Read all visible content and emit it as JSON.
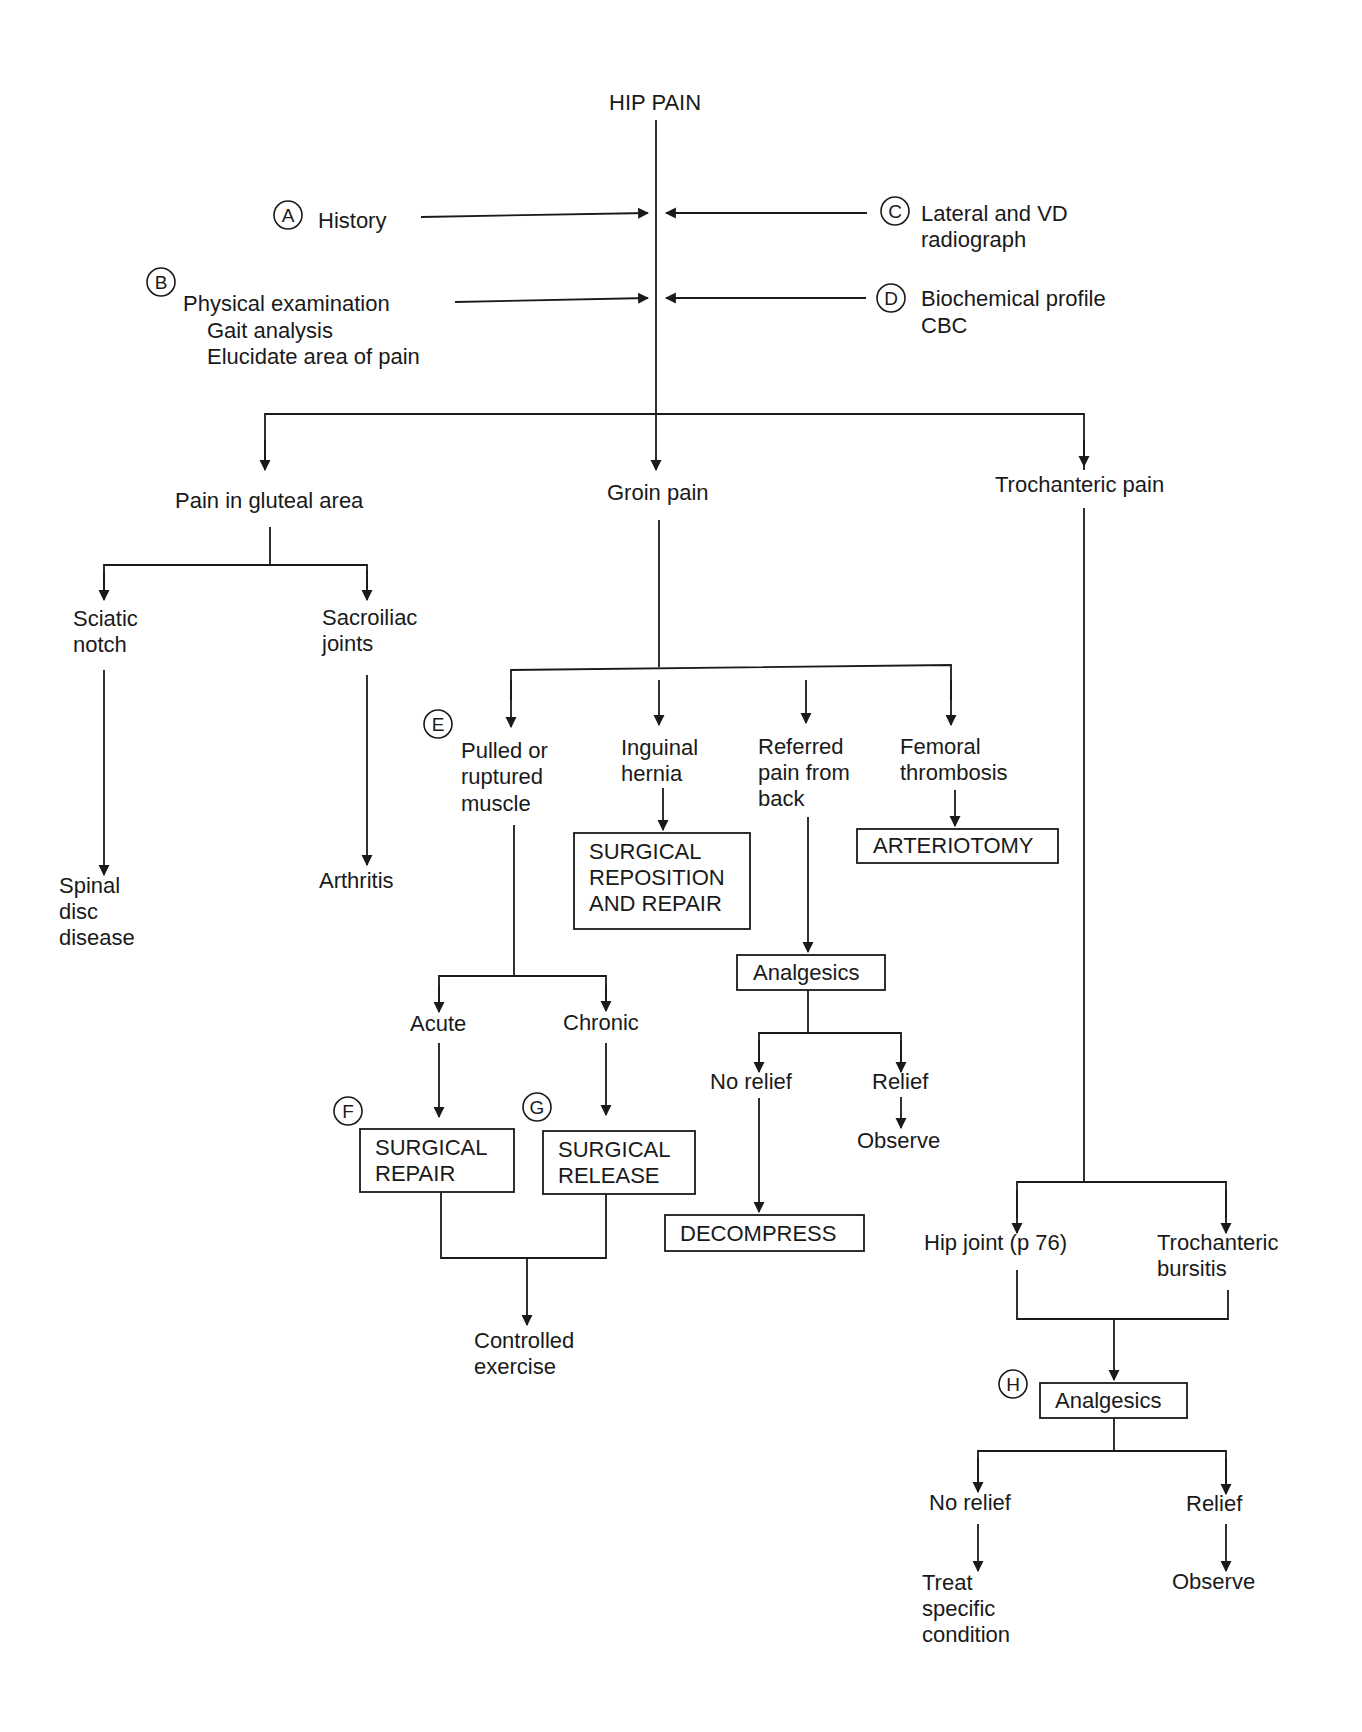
{
  "title": "HIP PAIN",
  "inputs": {
    "A": {
      "marker": "A",
      "lines": [
        "History"
      ]
    },
    "B": {
      "marker": "B",
      "lines": [
        "Physical examination",
        "Gait analysis",
        "Elucidate area of pain"
      ]
    },
    "C": {
      "marker": "C",
      "lines": [
        "Lateral and VD",
        "radiograph"
      ]
    },
    "D": {
      "marker": "D",
      "lines": [
        "Biochemical profile",
        "CBC"
      ]
    }
  },
  "branches": {
    "gluteal": {
      "label": "Pain in gluteal area",
      "sciatic": {
        "lines": [
          "Sciatic",
          "notch"
        ],
        "result": [
          "Spinal",
          "disc",
          "disease"
        ]
      },
      "sacroiliac": {
        "lines": [
          "Sacroiliac",
          "joints"
        ],
        "result": [
          "Arthritis"
        ]
      }
    },
    "groin": {
      "label": "Groin pain",
      "muscle": {
        "marker": "E",
        "lines": [
          "Pulled or",
          "ruptured",
          "muscle"
        ],
        "acute": {
          "label": "Acute",
          "marker": "F",
          "box": [
            "SURGICAL",
            "REPAIR"
          ]
        },
        "chronic": {
          "label": "Chronic",
          "marker": "G",
          "box": [
            "SURGICAL",
            "RELEASE"
          ]
        },
        "result": [
          "Controlled",
          "exercise"
        ]
      },
      "hernia": {
        "lines": [
          "Inguinal",
          "hernia"
        ],
        "box": [
          "SURGICAL",
          "REPOSITION",
          "AND REPAIR"
        ]
      },
      "referred": {
        "lines": [
          "Referred",
          "pain from",
          "back"
        ],
        "box": [
          "Analgesics"
        ],
        "no_relief": {
          "label": "No relief",
          "box": [
            "DECOMPRESS"
          ]
        },
        "relief": {
          "label": "Relief",
          "result": "Observe"
        }
      },
      "femoral": {
        "lines": [
          "Femoral",
          "thrombosis"
        ],
        "box": [
          "ARTERIOTOMY"
        ]
      }
    },
    "trochanteric": {
      "label": "Trochanteric pain",
      "hip_joint": {
        "label": "Hip joint (p 76)"
      },
      "bursitis": {
        "lines": [
          "Trochanteric",
          "bursitis"
        ]
      },
      "analgesics": {
        "marker": "H",
        "box": [
          "Analgesics"
        ]
      },
      "no_relief": {
        "label": "No relief",
        "result": [
          "Treat",
          "specific",
          "condition"
        ]
      },
      "relief": {
        "label": "Relief",
        "result": "Observe"
      }
    }
  }
}
